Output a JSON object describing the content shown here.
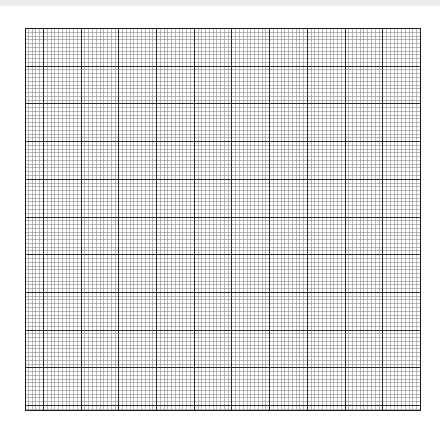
{
  "page": {
    "width": 440,
    "height": 427,
    "background": "#ffffff",
    "top_bar_color": "#ebebeb"
  },
  "grid": {
    "left": 25,
    "top": 28,
    "right": 420,
    "bottom": 410,
    "major_spacing": 37.7,
    "minor_divisions": 10,
    "major_color": "#2a2a2a",
    "minor_color": "#8a8a8a",
    "border_color": "#1e1e1e",
    "major_width": 1,
    "minor_width": 0.6,
    "vertical_majors_from_right": true,
    "horizontal_majors_from_top": true
  }
}
